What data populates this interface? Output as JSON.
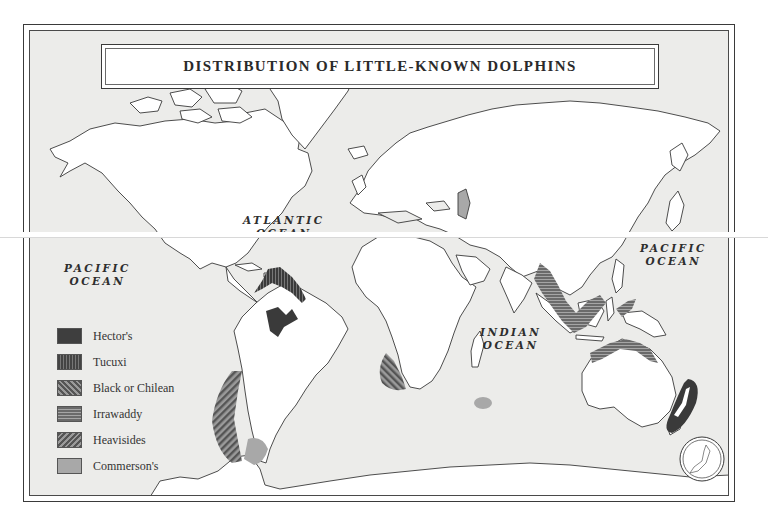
{
  "map": {
    "title": "DISTRIBUTION OF LITTLE-KNOWN DOLPHINS",
    "ocean_labels": {
      "atlantic": [
        "ATLANTIC",
        "OCEAN"
      ],
      "pacific_west": [
        "PACIFIC",
        "OCEAN"
      ],
      "pacific_east": [
        "PACIFIC",
        "OCEAN"
      ],
      "indian": [
        "INDIAN",
        "OCEAN"
      ]
    },
    "legend": [
      {
        "label": "Hector's",
        "pattern": "solid-dark",
        "color": "#3e3e3e"
      },
      {
        "label": "Tucuxi",
        "pattern": "vertical-stripes",
        "color": "#444444"
      },
      {
        "label": "Black or Chilean",
        "pattern": "diagonal-stripes-down",
        "color": "#555555"
      },
      {
        "label": "Irrawaddy",
        "pattern": "horizontal-stripes",
        "color": "#6a6a6a"
      },
      {
        "label": "Heavisides",
        "pattern": "diagonal-stripes-up",
        "color": "#555555"
      },
      {
        "label": "Commerson's",
        "pattern": "solid-light",
        "color": "#a8a8a8"
      }
    ],
    "regions": [
      {
        "species": "Tucuxi",
        "location": "Amazon / northern South America coast"
      },
      {
        "species": "Black or Chilean",
        "location": "Chilean coast"
      },
      {
        "species": "Commerson's",
        "location": "Patagonia, Kerguelen Islands"
      },
      {
        "species": "Heavisides",
        "location": "Southwest Africa coast"
      },
      {
        "species": "Irrawaddy",
        "location": "Southeast Asia, northern Australia"
      },
      {
        "species": "Hector's",
        "location": "New Zealand"
      }
    ],
    "inset": "Japan inset (circular)",
    "colors": {
      "ocean": "#ececea",
      "land": "#ffffff",
      "outline": "#3a3a3a"
    }
  }
}
